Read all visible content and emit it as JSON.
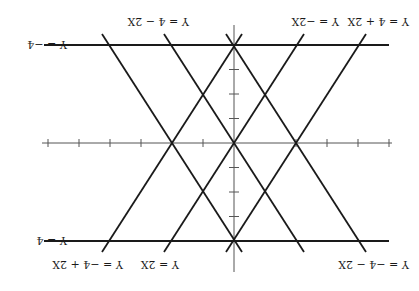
{
  "figure": {
    "orientation": "rotated 180 degrees",
    "axes": {
      "origin_label": "",
      "x_ticks": [
        -6,
        -5,
        -4,
        -3,
        -2,
        -1,
        1,
        2,
        3,
        4,
        5
      ],
      "y_ticks": [
        -3,
        -2,
        -1,
        1,
        2,
        3
      ]
    },
    "lines": [
      {
        "id": "y-eq-4",
        "label": "Y = 4"
      },
      {
        "id": "y-eq-neg4",
        "label": "Y = −4"
      },
      {
        "id": "y-eq-2x",
        "label": "Y = 2X"
      },
      {
        "id": "y-eq-neg2x",
        "label": "Y = −2X"
      },
      {
        "id": "y-eq-4-plus-2x",
        "label": "Y = 4 + 2X"
      },
      {
        "id": "y-eq-4-minus-2x",
        "label": "Y = 4 − 2X"
      },
      {
        "id": "y-eq-neg4-plus-2x",
        "label": "Y = −4 + 2X"
      },
      {
        "id": "y-eq-neg4-minus-2x",
        "label": "Y = −4 − 2X"
      }
    ],
    "colors": {
      "ink": "#1a1a1a",
      "axis": "#555555",
      "background": "#ffffff"
    }
  }
}
